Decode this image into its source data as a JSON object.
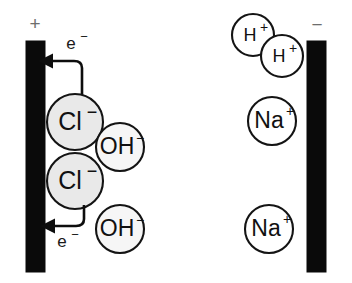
{
  "diagram": {
    "background_color": "#ffffff",
    "electrode_color": "#0a0a0a",
    "anion_fill_color": "#e9e9e9",
    "hydroxide_fill_color": "#f6f6f6",
    "cation_fill_color": "#ffffff",
    "outline_color": "#141414",
    "polarity_label_color": "#6d6d6d"
  },
  "electrodes": [
    {
      "name": "anode",
      "polarity_symbol": "+",
      "side": "left"
    },
    {
      "name": "cathode",
      "polarity_symbol": "−",
      "side": "right"
    }
  ],
  "electron_arrows": [
    {
      "name": "electron-arrow-upper",
      "label": "e",
      "charge": "−",
      "direction": "left-toward-anode"
    },
    {
      "name": "electron-arrow-lower",
      "label": "e",
      "charge": "−",
      "direction": "left-toward-anode"
    }
  ],
  "ions": [
    {
      "name": "chloride-ion-upper",
      "species": "Cl",
      "charge": "−",
      "fill": "shaded",
      "region": "anode"
    },
    {
      "name": "chloride-ion-lower",
      "species": "Cl",
      "charge": "−",
      "fill": "shaded",
      "region": "anode"
    },
    {
      "name": "hydroxide-ion-upper",
      "species": "OH",
      "charge": "−",
      "fill": "light",
      "region": "solution-left"
    },
    {
      "name": "hydroxide-ion-lower",
      "species": "OH",
      "charge": "−",
      "fill": "light",
      "region": "solution-left"
    },
    {
      "name": "hydrogen-ion-upper",
      "species": "H",
      "charge": "+",
      "fill": "white",
      "region": "cathode"
    },
    {
      "name": "hydrogen-ion-lower",
      "species": "H",
      "charge": "+",
      "fill": "white",
      "region": "cathode"
    },
    {
      "name": "sodium-ion-upper",
      "species": "Na",
      "charge": "+",
      "fill": "white",
      "region": "cathode"
    },
    {
      "name": "sodium-ion-lower",
      "species": "Na",
      "charge": "+",
      "fill": "white",
      "region": "cathode"
    }
  ]
}
